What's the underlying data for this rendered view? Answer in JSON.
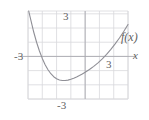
{
  "figure": {
    "kind": "cartesian-graph",
    "background": "#ffffff",
    "grid_color": "#d8d8dc",
    "axis_color": "#a9a9b0",
    "curve_color": "#8f8f96",
    "label_color": "#5f5f5f"
  },
  "labels": {
    "y_positive_tick": "3",
    "x_negative_tick": "-3",
    "x_positive_tick": "3",
    "y_negative_tick": "-3",
    "x_axis_name": "x",
    "function_name": "f(x)"
  },
  "chart_data": {
    "type": "line",
    "title": "",
    "xlabel": "x",
    "ylabel": "",
    "legend": [
      "f(x)"
    ],
    "legend_position": "right-end-of-curve",
    "grid": true,
    "xlim": [
      -4,
      3
    ],
    "ylim": [
      -3,
      3.2
    ],
    "xticks": [
      -3,
      3
    ],
    "yticks": [
      3,
      -3
    ],
    "xtick_labels": [
      "-3",
      "3"
    ],
    "ytick_labels": [
      "3",
      "-3"
    ],
    "gridline_spacing": 1,
    "axes_through_origin": true,
    "series": [
      {
        "name": "f(x)",
        "x": [
          -3.95,
          -3.8,
          -3.6,
          -3.4,
          -3.2,
          -3.0,
          -2.8,
          -2.6,
          -2.4,
          -2.2,
          -2.0,
          -1.8,
          -1.6,
          -1.4,
          -1.2,
          -1.0,
          -0.8,
          -0.6,
          -0.4,
          -0.2,
          0.0,
          0.3,
          0.6,
          0.9,
          1.2,
          1.5,
          1.8,
          2.1,
          2.4,
          2.7,
          3.0
        ],
        "y": [
          3.2,
          2.55,
          1.72,
          1.0,
          0.38,
          -0.14,
          -0.58,
          -0.94,
          -1.22,
          -1.43,
          -1.57,
          -1.66,
          -1.7,
          -1.7,
          -1.67,
          -1.61,
          -1.54,
          -1.45,
          -1.35,
          -1.24,
          -1.12,
          -0.92,
          -0.7,
          -0.45,
          -0.17,
          0.14,
          0.49,
          0.88,
          1.3,
          1.76,
          2.25
        ],
        "annotations": [
          {
            "text": "f(x)",
            "x": 3.0,
            "y": 2.25,
            "placement": "right"
          }
        ]
      }
    ]
  }
}
